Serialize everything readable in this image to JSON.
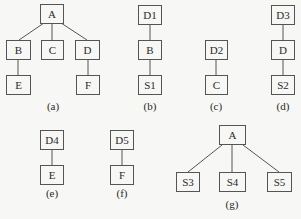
{
  "diagrams": {
    "a": {
      "caption": "(a)",
      "nodes": {
        "A": "A",
        "B": "B",
        "C": "C",
        "D": "D",
        "E": "E",
        "F": "F"
      },
      "edges": [
        [
          "A",
          "B"
        ],
        [
          "A",
          "C"
        ],
        [
          "A",
          "D"
        ],
        [
          "B",
          "E"
        ],
        [
          "D",
          "F"
        ]
      ]
    },
    "b": {
      "caption": "(b)",
      "nodes": {
        "D1": "D1",
        "B": "B",
        "S1": "S1"
      },
      "edges": [
        [
          "D1",
          "B"
        ],
        [
          "B",
          "S1"
        ]
      ]
    },
    "c": {
      "caption": "(c)",
      "nodes": {
        "D2": "D2",
        "C": "C"
      },
      "edges": [
        [
          "D2",
          "C"
        ]
      ]
    },
    "d": {
      "caption": "(d)",
      "nodes": {
        "D3": "D3",
        "D": "D",
        "S2": "S2"
      },
      "edges": [
        [
          "D3",
          "D"
        ],
        [
          "D",
          "S2"
        ]
      ]
    },
    "e": {
      "caption": "(e)",
      "nodes": {
        "D4": "D4",
        "E": "E"
      },
      "edges": [
        [
          "D4",
          "E"
        ]
      ]
    },
    "f": {
      "caption": "(f)",
      "nodes": {
        "D5": "D5",
        "F": "F"
      },
      "edges": [
        [
          "D5",
          "F"
        ]
      ]
    },
    "g": {
      "caption": "(g)",
      "nodes": {
        "A": "A",
        "S3": "S3",
        "S4": "S4",
        "S5": "S5"
      },
      "edges": [
        [
          "A",
          "S3"
        ],
        [
          "A",
          "S4"
        ],
        [
          "A",
          "S5"
        ]
      ]
    }
  }
}
